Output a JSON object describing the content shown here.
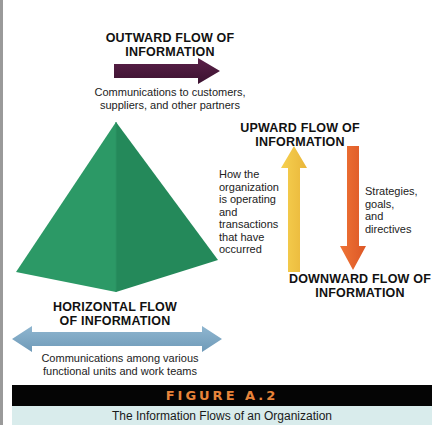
{
  "diagram": {
    "type": "information-flow",
    "center_shape": {
      "name": "organization-pyramid",
      "color_light": "#2f9e6a",
      "color_dark": "#228a58"
    },
    "flows": {
      "outward": {
        "heading_line1": "OUTWARD FLOW OF",
        "heading_line2": "INFORMATION",
        "description_line1": "Communications to customers,",
        "description_line2": "suppliers, and other partners",
        "arrow_color": "#4a1a3c",
        "direction": "right"
      },
      "upward": {
        "heading_line1": "UPWARD FLOW OF",
        "heading_line2": "INFORMATION",
        "description_lines": [
          "How the",
          "organization",
          "is operating",
          "and",
          "transactions",
          "that have",
          "occurred"
        ],
        "arrow_color": "#f0c040",
        "direction": "up"
      },
      "downward": {
        "heading_line1": "DOWNWARD FLOW OF",
        "heading_line2": "INFORMATION",
        "description_lines": [
          "Strategies,",
          "goals,",
          "and",
          "directives"
        ],
        "arrow_color": "#e8652f",
        "direction": "down"
      },
      "horizontal": {
        "heading_line1": "HORIZONTAL FLOW",
        "heading_line2": "OF INFORMATION",
        "description_line1": "Communications among various",
        "description_line2": "functional units and work teams",
        "arrow_color": "#7fa8c4",
        "direction": "both"
      }
    }
  },
  "figure": {
    "label": "FIGURE A.2",
    "caption": "The Information Flows of an Organization",
    "bar_color": "#050505",
    "label_color": "#e8843a",
    "caption_bg": "#d9ecec"
  }
}
